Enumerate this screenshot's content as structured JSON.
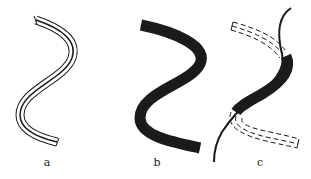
{
  "figure": {
    "panels": [
      {
        "id": "a",
        "label": "a",
        "description": "S-shaped band with outer outline and thick central line"
      },
      {
        "id": "b",
        "label": "b",
        "description": "S-shaped band filled with hatching and a thick central line"
      },
      {
        "id": "c",
        "label": "c",
        "description": "Dashed original band shifted, hatched overlap segment, and a crossing solid curve"
      }
    ],
    "colors": {
      "stroke": "#1a1a1a",
      "background": "#ffffff"
    }
  }
}
